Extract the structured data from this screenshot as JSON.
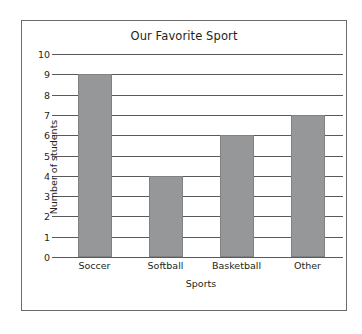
{
  "chart_data": {
    "type": "bar",
    "title": "Our Favorite Sport",
    "xlabel": "Sports",
    "ylabel": "Number of students",
    "categories": [
      "Soccer",
      "Softball",
      "Basketball",
      "Other"
    ],
    "values": [
      9,
      4,
      6,
      7
    ],
    "ylim": [
      0,
      10
    ],
    "yticks": [
      10,
      9,
      8,
      7,
      6,
      5,
      4,
      3,
      2,
      1,
      0
    ],
    "grid": true,
    "legend": "none",
    "colors": {
      "bar_fill": "#969798",
      "bar_edge": "#808183",
      "gridline": "#58595b",
      "frame": "#6b6b6b",
      "text": "#231f20",
      "background": "#ffffff"
    }
  }
}
